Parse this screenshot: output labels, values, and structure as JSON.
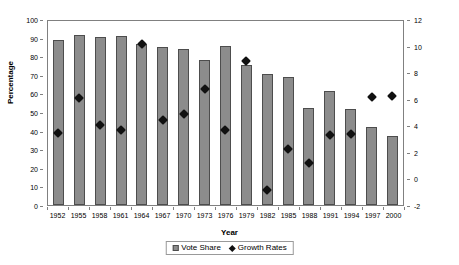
{
  "chart_data": {
    "type": "bar",
    "title": "",
    "xlabel": "Year",
    "ylabel": "Percentage",
    "ylim": [
      0,
      100
    ],
    "y2lim": [
      -2,
      12
    ],
    "grid": false,
    "legend_position": "bottom",
    "categories": [
      "1952",
      "1955",
      "1958",
      "1961",
      "1964",
      "1967",
      "1970",
      "1973",
      "1976",
      "1979",
      "1982",
      "1985",
      "1988",
      "1991",
      "1994",
      "1997",
      "2000"
    ],
    "series": [
      {
        "name": "Vote Share",
        "axis": "left",
        "marker": "square",
        "color": "#8c8c8c",
        "values": [
          88.5,
          91.5,
          90.5,
          91.0,
          86.5,
          85.0,
          84.0,
          78.0,
          85.5,
          75.5,
          70.5,
          69.0,
          52.0,
          61.5,
          51.5,
          42.0,
          37.0
        ]
      },
      {
        "name": "Growth Rates",
        "axis": "right",
        "marker": "diamond",
        "color": "#111111",
        "values": [
          3.7,
          6.3,
          4.3,
          3.9,
          10.4,
          4.7,
          5.1,
          7.0,
          3.9,
          9.1,
          -0.6,
          2.5,
          1.4,
          3.5,
          3.6,
          6.4,
          6.5
        ]
      }
    ],
    "y_ticks_left": [
      "0",
      "10",
      "20",
      "30",
      "40",
      "50",
      "60",
      "70",
      "80",
      "90",
      "100"
    ],
    "y_ticks_right": [
      "-2",
      "0",
      "2",
      "4",
      "6",
      "8",
      "10",
      "12"
    ]
  },
  "legend": {
    "items": [
      {
        "label": "Vote Share",
        "icon": "square-marker-icon"
      },
      {
        "label": "Growth Rates",
        "icon": "diamond-marker-icon"
      }
    ]
  }
}
